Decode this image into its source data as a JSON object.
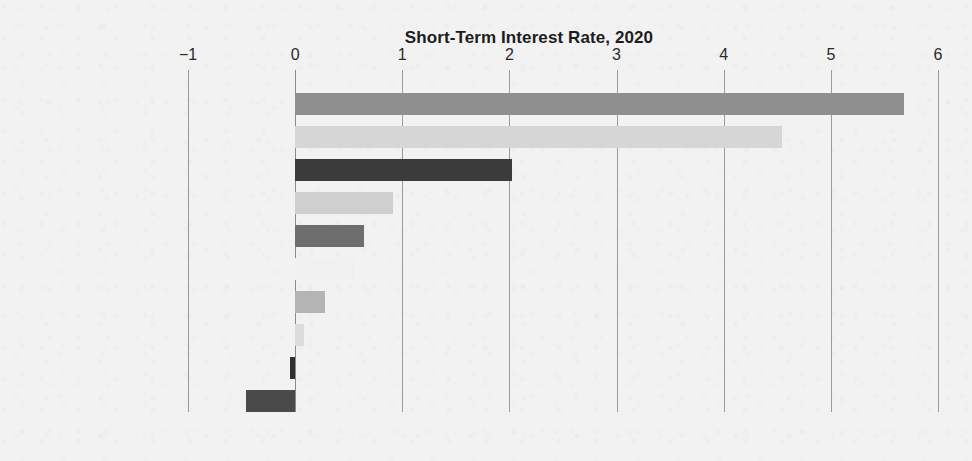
{
  "chart_data": {
    "type": "bar",
    "orientation": "horizontal",
    "title": "Short-Term Interest Rate, 2020",
    "xlabel": "",
    "ylabel": "",
    "xlim": [
      -1,
      6
    ],
    "xticks": [
      -1,
      0,
      1,
      2,
      3,
      4,
      5,
      6
    ],
    "xtick_labels": [
      "−1",
      "0",
      "1",
      "2",
      "3",
      "4",
      "5",
      "6"
    ],
    "grid": "vertical",
    "legend": "none",
    "categories": [
      "Mexico",
      "South Africa",
      "Iceland",
      "South Korea",
      "Canada",
      "United States",
      "Australia",
      "Israel",
      "Japan",
      "France"
    ],
    "values": [
      5.68,
      4.54,
      2.02,
      0.91,
      0.64,
      0.56,
      0.28,
      0.08,
      -0.05,
      -0.46
    ],
    "bar_colors": [
      "#8f8f8f",
      "#d6d6d6",
      "#3b3b3b",
      "#cfcfcf",
      "#6e6e6e",
      "#f0f0f0",
      "#b4b4b4",
      "#dcdcdc",
      "#2f2f2f",
      "#4a4a4a"
    ]
  },
  "style": {
    "background": "#f2f2f2",
    "axis_color": "#9a9a9a",
    "text_color": "#1f1f1f",
    "title_color": "#1d1d1d"
  }
}
